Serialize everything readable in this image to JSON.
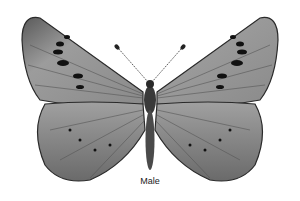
{
  "figure": {
    "caption": "Male",
    "colors": {
      "wing": "#9a9a9a",
      "wing_dark": "#3a3a3a",
      "spot": "#111111",
      "background": "#ffffff"
    }
  }
}
